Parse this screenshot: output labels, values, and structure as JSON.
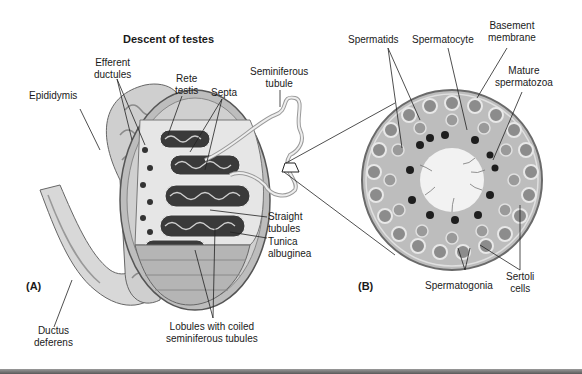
{
  "figure": {
    "title": "Descent of testes",
    "panels": [
      {
        "id": "A",
        "label": "(A)",
        "labels": {
          "epididymis": "Epididymis",
          "efferent_ductules": [
            "Efferent",
            "ductules"
          ],
          "rete_testis": [
            "Rete",
            "testis"
          ],
          "septa": "Septa",
          "seminiferous_tubule": [
            "Seminiferous",
            "tubule"
          ],
          "straight_tubules": [
            "Straight",
            "tubules"
          ],
          "tunica_albuginea": [
            "Tunica",
            "albuginea"
          ],
          "ductus_deferens": [
            "Ductus",
            "deferens"
          ],
          "lobules": [
            "Lobules with coiled",
            "seminiferous tubules"
          ]
        }
      },
      {
        "id": "B",
        "label": "(B)",
        "labels": {
          "spermatids": "Spermatids",
          "spermatocyte": "Spermatocyte",
          "basement_membrane": [
            "Basement",
            "membrane"
          ],
          "mature_spermatozoa": [
            "Mature",
            "spermatozoa"
          ],
          "spermatogonia": "Spermatogonia",
          "sertoli_cells": [
            "Sertoli",
            "cells"
          ]
        }
      }
    ],
    "colors": {
      "background": "#ffffff",
      "line": "#222222",
      "tissue_light": "#d6d6d6",
      "tissue_mid": "#a8a8a8",
      "tissue_dark": "#4a4a4a",
      "nucleus": "#1e1e1e",
      "lumen": "#f2f2f2"
    }
  }
}
